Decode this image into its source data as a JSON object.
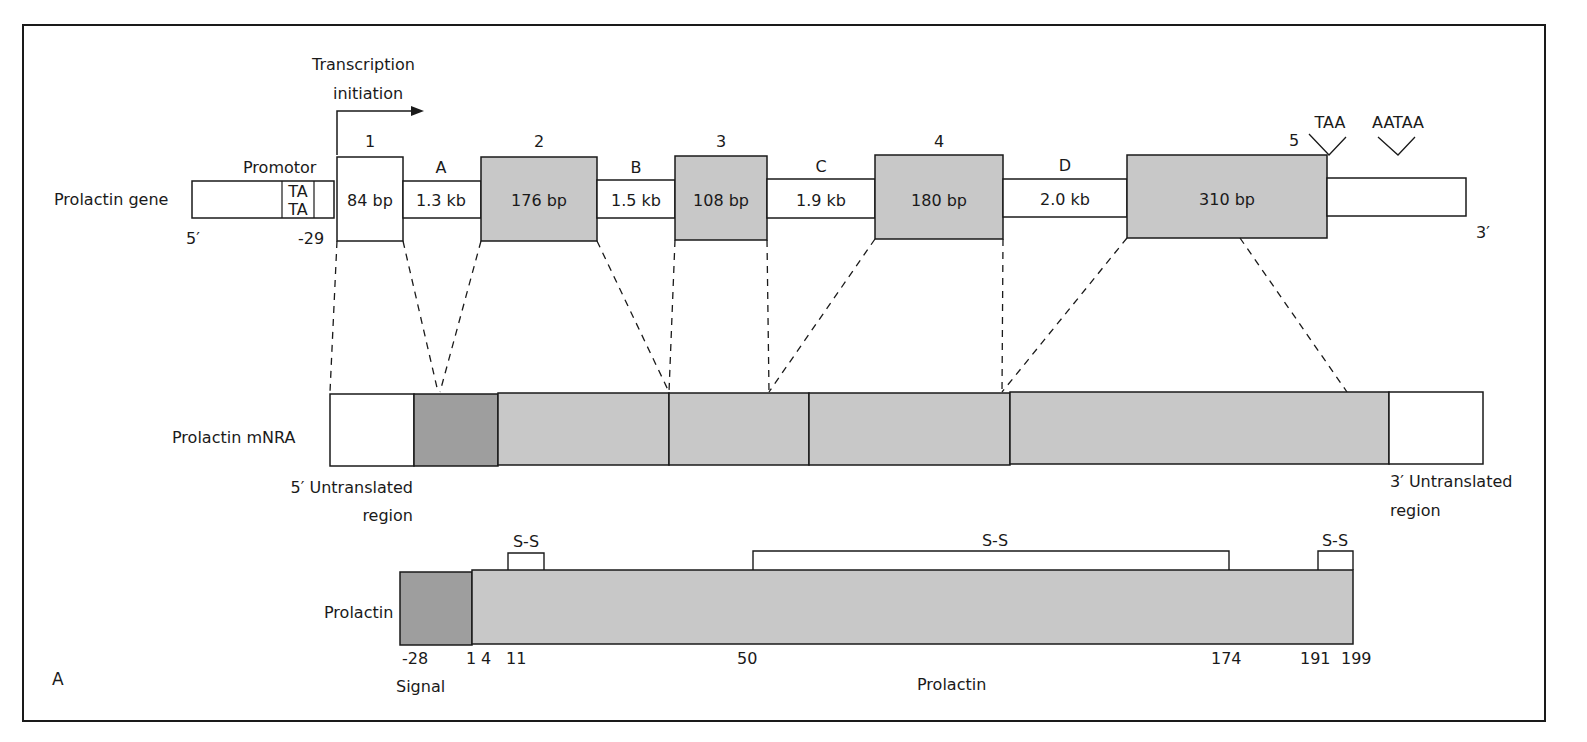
{
  "figure": {
    "panel_label": "A",
    "frame": {
      "x": 23,
      "y": 25,
      "w": 1522,
      "h": 696
    }
  },
  "colors": {
    "line": "#1a1a1a",
    "exon_fill": "#c8c8c8",
    "signal_fill": "#9e9e9e",
    "utr_fill": "#ffffff"
  },
  "gene": {
    "label": "Prolactin gene",
    "five_prime": "5′",
    "three_prime": "3′",
    "promoter_label": "Promotor",
    "tata_top": "TA",
    "tata_bottom": "TA",
    "promoter_position": "-29",
    "transcription_label_line1": "Transcription",
    "transcription_label_line2": "initiation",
    "stop_codon": "TAA",
    "polyA_signal": "AATAA",
    "exons": [
      {
        "number": "1",
        "size": "84 bp",
        "shaded": false
      },
      {
        "number": "2",
        "size": "176 bp",
        "shaded": true
      },
      {
        "number": "3",
        "size": "108 bp",
        "shaded": true
      },
      {
        "number": "4",
        "size": "180 bp",
        "shaded": true
      },
      {
        "number": "5",
        "size": "310 bp",
        "shaded": true
      }
    ],
    "introns": [
      {
        "letter": "A",
        "size": "1.3 kb"
      },
      {
        "letter": "B",
        "size": "1.5 kb"
      },
      {
        "letter": "C",
        "size": "1.9 kb"
      },
      {
        "letter": "D",
        "size": "2.0 kb"
      }
    ]
  },
  "mrna": {
    "label": "Prolactin mNRA",
    "utr5_line1": "5′ Untranslated",
    "utr5_line2": "region",
    "utr3_line1": "3′ Untranslated",
    "utr3_line2": "region"
  },
  "protein": {
    "label": "Prolactin",
    "signal_label": "Signal",
    "mature_label": "Prolactin",
    "disulfide_label": "S-S",
    "positions": [
      "-28",
      "1",
      "4",
      "11",
      "50",
      "174",
      "191",
      "199"
    ],
    "disulfide_bonds": [
      {
        "from": "4",
        "to": "11"
      },
      {
        "from": "50",
        "to": "174"
      },
      {
        "from": "191",
        "to": "199"
      }
    ]
  }
}
